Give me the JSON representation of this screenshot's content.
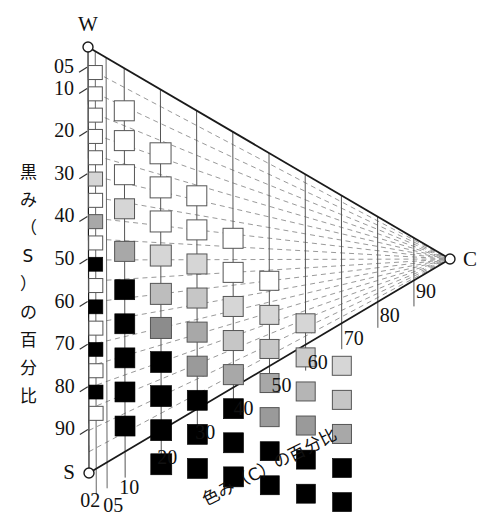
{
  "figure": {
    "vertices": [
      {
        "name": "W",
        "label": "W",
        "x": 88,
        "y": 47
      },
      {
        "name": "S",
        "label": "S",
        "x": 89,
        "y": 473
      },
      {
        "name": "C",
        "label": "C",
        "x": 450,
        "y": 259
      }
    ],
    "axis_titles": {
      "vertical": "黒み（S）の百分比",
      "diagonal": "色み（C）の百分比"
    }
  },
  "chart_data": {
    "type": "scatter",
    "title": "",
    "xlabel": "色み（C）の百分比",
    "ylabel": "黒み（S）の百分比",
    "grid": true,
    "legend": "none",
    "x_tick_labels": [
      "02",
      "05",
      "10",
      "20",
      "30",
      "40",
      "50",
      "60",
      "70",
      "80",
      "90"
    ],
    "x_tick_values": [
      2,
      5,
      10,
      20,
      30,
      40,
      50,
      60,
      70,
      80,
      90
    ],
    "y_tick_labels": [
      "05",
      "10",
      "20",
      "30",
      "40",
      "50",
      "60",
      "70",
      "80",
      "90"
    ],
    "y_tick_values": [
      5,
      10,
      20,
      30,
      40,
      50,
      60,
      70,
      80,
      90
    ],
    "xlim": [
      0,
      100
    ],
    "ylim": [
      0,
      100
    ],
    "note": "Hue-triangle (tone) chart: each marker is a square swatch at (C,S); fill lightness decreases as S increases.",
    "swatches": [
      {
        "c": 2,
        "s": 5,
        "fill": "#ffffff"
      },
      {
        "c": 2,
        "s": 10,
        "fill": "#ffffff"
      },
      {
        "c": 2,
        "s": 15,
        "fill": "#ffffff"
      },
      {
        "c": 2,
        "s": 20,
        "fill": "#ffffff"
      },
      {
        "c": 2,
        "s": 25,
        "fill": "#ffffff"
      },
      {
        "c": 2,
        "s": 30,
        "fill": "#d6d6d6"
      },
      {
        "c": 2,
        "s": 35,
        "fill": "#ffffff"
      },
      {
        "c": 2,
        "s": 40,
        "fill": "#a8a8a8"
      },
      {
        "c": 2,
        "s": 45,
        "fill": "#ffffff"
      },
      {
        "c": 2,
        "s": 50,
        "fill": "#000000"
      },
      {
        "c": 2,
        "s": 55,
        "fill": "#ffffff"
      },
      {
        "c": 2,
        "s": 60,
        "fill": "#000000"
      },
      {
        "c": 2,
        "s": 65,
        "fill": "#ffffff"
      },
      {
        "c": 2,
        "s": 70,
        "fill": "#000000"
      },
      {
        "c": 2,
        "s": 75,
        "fill": "#ffffff"
      },
      {
        "c": 2,
        "s": 80,
        "fill": "#000000"
      },
      {
        "c": 2,
        "s": 85,
        "fill": "#ffffff"
      },
      {
        "c": 10,
        "s": 10,
        "fill": "#ffffff"
      },
      {
        "c": 10,
        "s": 17,
        "fill": "#ffffff"
      },
      {
        "c": 10,
        "s": 25,
        "fill": "#ffffff"
      },
      {
        "c": 10,
        "s": 33,
        "fill": "#d6d6d6"
      },
      {
        "c": 10,
        "s": 43,
        "fill": "#a8a8a8"
      },
      {
        "c": 10,
        "s": 52,
        "fill": "#000000"
      },
      {
        "c": 10,
        "s": 60,
        "fill": "#000000"
      },
      {
        "c": 10,
        "s": 68,
        "fill": "#000000"
      },
      {
        "c": 10,
        "s": 76,
        "fill": "#000000"
      },
      {
        "c": 10,
        "s": 84,
        "fill": "#000000"
      },
      {
        "c": 20,
        "s": 15,
        "fill": "#ffffff"
      },
      {
        "c": 20,
        "s": 23,
        "fill": "#ffffff"
      },
      {
        "c": 20,
        "s": 31,
        "fill": "#ffffff"
      },
      {
        "c": 20,
        "s": 39,
        "fill": "#d6d6d6"
      },
      {
        "c": 20,
        "s": 48,
        "fill": "#bdbdbd"
      },
      {
        "c": 20,
        "s": 56,
        "fill": "#8c8c8c"
      },
      {
        "c": 20,
        "s": 64,
        "fill": "#000000"
      },
      {
        "c": 20,
        "s": 72,
        "fill": "#000000"
      },
      {
        "c": 20,
        "s": 80,
        "fill": "#000000"
      },
      {
        "c": 20,
        "s": 88,
        "fill": "#000000"
      },
      {
        "c": 30,
        "s": 20,
        "fill": "#ffffff"
      },
      {
        "c": 30,
        "s": 28,
        "fill": "#ffffff"
      },
      {
        "c": 30,
        "s": 36,
        "fill": "#d6d6d6"
      },
      {
        "c": 30,
        "s": 44,
        "fill": "#c6c6c6"
      },
      {
        "c": 30,
        "s": 52,
        "fill": "#a8a8a8"
      },
      {
        "c": 30,
        "s": 60,
        "fill": "#9a9a9a"
      },
      {
        "c": 30,
        "s": 68,
        "fill": "#000000"
      },
      {
        "c": 30,
        "s": 76,
        "fill": "#000000"
      },
      {
        "c": 30,
        "s": 84,
        "fill": "#000000"
      },
      {
        "c": 40,
        "s": 25,
        "fill": "#ffffff"
      },
      {
        "c": 40,
        "s": 33,
        "fill": "#ffffff"
      },
      {
        "c": 40,
        "s": 41,
        "fill": "#d6d6d6"
      },
      {
        "c": 40,
        "s": 49,
        "fill": "#c6c6c6"
      },
      {
        "c": 40,
        "s": 57,
        "fill": "#a8a8a8"
      },
      {
        "c": 40,
        "s": 65,
        "fill": "#000000"
      },
      {
        "c": 40,
        "s": 73,
        "fill": "#000000"
      },
      {
        "c": 40,
        "s": 81,
        "fill": "#000000"
      },
      {
        "c": 50,
        "s": 30,
        "fill": "#ffffff"
      },
      {
        "c": 50,
        "s": 38,
        "fill": "#d6d6d6"
      },
      {
        "c": 50,
        "s": 46,
        "fill": "#c6c6c6"
      },
      {
        "c": 50,
        "s": 54,
        "fill": "#a8a8a8"
      },
      {
        "c": 50,
        "s": 62,
        "fill": "#9a9a9a"
      },
      {
        "c": 50,
        "s": 70,
        "fill": "#000000"
      },
      {
        "c": 50,
        "s": 78,
        "fill": "#000000"
      },
      {
        "c": 60,
        "s": 35,
        "fill": "#d6d6d6"
      },
      {
        "c": 60,
        "s": 43,
        "fill": "#cccccc"
      },
      {
        "c": 60,
        "s": 51,
        "fill": "#b5b5b5"
      },
      {
        "c": 60,
        "s": 59,
        "fill": "#9a9a9a"
      },
      {
        "c": 60,
        "s": 67,
        "fill": "#000000"
      },
      {
        "c": 60,
        "s": 75,
        "fill": "#000000"
      },
      {
        "c": 70,
        "s": 40,
        "fill": "#d6d6d6"
      },
      {
        "c": 70,
        "s": 48,
        "fill": "#c6c6c6"
      },
      {
        "c": 70,
        "s": 56,
        "fill": "#a8a8a8"
      },
      {
        "c": 70,
        "s": 64,
        "fill": "#000000"
      },
      {
        "c": 70,
        "s": 72,
        "fill": "#000000"
      }
    ]
  }
}
